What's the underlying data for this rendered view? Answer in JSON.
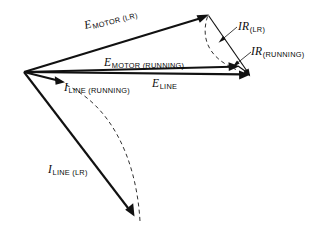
{
  "figure": {
    "type": "phasor-diagram",
    "background_color": "#ffffff",
    "stroke_color": "#111111"
  },
  "labels": {
    "e_motor_lr": {
      "symbol": "E",
      "subscript": "MOTOR (LR)"
    },
    "e_motor_running": {
      "symbol": "E",
      "subscript": "MOTOR (RUNNING)"
    },
    "e_line": {
      "symbol": "E",
      "subscript": "LINE"
    },
    "ir_lr": {
      "symbol": "IR",
      "subscript": "(LR)"
    },
    "ir_running": {
      "symbol": "IR",
      "subscript": "(RUNNING)"
    },
    "i_line_running": {
      "symbol": "I",
      "subscript": "LINE (RUNNING)"
    },
    "i_line_lr": {
      "symbol": "I",
      "subscript": "LINE (LR)"
    }
  },
  "geometry": {
    "origin": {
      "x": 24,
      "y": 72
    },
    "vectors": [
      {
        "name": "e-motor-lr",
        "x1": 24,
        "y1": 72,
        "x2": 208,
        "y2": 15,
        "weight": "heavy"
      },
      {
        "name": "e-motor-running",
        "x1": 24,
        "y1": 72,
        "x2": 238,
        "y2": 66,
        "weight": "heavy"
      },
      {
        "name": "e-line",
        "x1": 24,
        "y1": 72,
        "x2": 249,
        "y2": 74,
        "weight": "heavy"
      },
      {
        "name": "i-line-running",
        "x1": 24,
        "y1": 72,
        "x2": 64,
        "y2": 82,
        "weight": "heavy"
      },
      {
        "name": "i-line-lr",
        "x1": 24,
        "y1": 72,
        "x2": 134,
        "y2": 216,
        "weight": "heavy"
      },
      {
        "name": "ir-lr",
        "x1": 208,
        "y1": 15,
        "x2": 249,
        "y2": 74,
        "weight": "medium"
      },
      {
        "name": "ir-running",
        "x1": 238,
        "y1": 66,
        "x2": 249,
        "y2": 74,
        "weight": "medium"
      }
    ],
    "arcs": [
      {
        "name": "arc-e-motor",
        "from_x": 208,
        "from_y": 15,
        "to_x": 237,
        "to_y": 70
      },
      {
        "name": "arc-i-line",
        "from_x": 66,
        "from_y": 86,
        "to_x": 140,
        "to_y": 222
      }
    ],
    "leaders": [
      {
        "name": "leader-ir-lr",
        "x1": 236,
        "y1": 26,
        "x2": 219,
        "y2": 42
      },
      {
        "name": "leader-ir-running",
        "x1": 250,
        "y1": 51,
        "x2": 233,
        "y2": 67
      }
    ]
  }
}
